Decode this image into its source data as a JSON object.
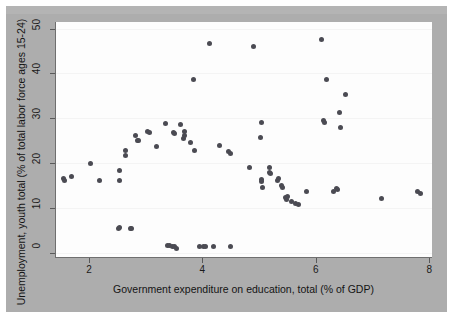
{
  "figure": {
    "background_color": "#adadad",
    "plot_background_color": "#fdfdfd",
    "marker_color": "#4b4b53",
    "axis_color": "#6f6f6f"
  },
  "chart_data": {
    "type": "scatter",
    "title": "",
    "subtitle": "",
    "xlabel": "Government expenditure on education, total (% of GDP)",
    "ylabel": "Unemployment, youth total (% of total labor force ages 15-24)",
    "xlim": [
      1.4,
      8.05
    ],
    "ylim": [
      -1.2,
      51.5
    ],
    "xticks": [
      2,
      4,
      6,
      8
    ],
    "yticks": [
      0,
      10,
      20,
      30,
      40,
      50
    ],
    "xtick_labels": [
      "2",
      "4",
      "6",
      "8"
    ],
    "ytick_labels": [
      "0",
      "10",
      "20",
      "30",
      "40",
      "50"
    ],
    "grid": "faint-horizontal",
    "legend": "none",
    "series": [
      {
        "name": "Countries",
        "marker": "circle",
        "color": "#4b4b53",
        "points": [
          [
            1.53,
            16.5
          ],
          [
            1.55,
            16.1
          ],
          [
            1.67,
            16.9
          ],
          [
            2.01,
            20.0
          ],
          [
            2.16,
            16.0
          ],
          [
            2.52,
            18.4
          ],
          [
            2.52,
            16.0
          ],
          [
            2.5,
            5.4
          ],
          [
            2.52,
            5.5
          ],
          [
            2.62,
            22.9
          ],
          [
            2.63,
            21.8
          ],
          [
            2.72,
            5.4
          ],
          [
            2.74,
            5.3
          ],
          [
            2.8,
            26.2
          ],
          [
            2.83,
            25.1
          ],
          [
            2.85,
            25.0
          ],
          [
            3.02,
            27.0
          ],
          [
            3.05,
            26.8
          ],
          [
            3.17,
            23.7
          ],
          [
            3.33,
            28.8
          ],
          [
            3.36,
            1.5
          ],
          [
            3.4,
            1.5
          ],
          [
            3.45,
            1.4
          ],
          [
            3.49,
            1.3
          ],
          [
            3.52,
            1.0
          ],
          [
            3.47,
            26.8
          ],
          [
            3.49,
            26.5
          ],
          [
            3.6,
            28.5
          ],
          [
            3.66,
            27.0
          ],
          [
            3.67,
            26.2
          ],
          [
            3.65,
            25.5
          ],
          [
            3.78,
            24.5
          ],
          [
            3.82,
            38.6
          ],
          [
            3.85,
            22.9
          ],
          [
            3.94,
            1.3
          ],
          [
            4.0,
            1.4
          ],
          [
            4.04,
            1.3
          ],
          [
            4.1,
            46.8
          ],
          [
            4.18,
            1.3
          ],
          [
            4.28,
            24.0
          ],
          [
            4.47,
            1.4
          ],
          [
            4.45,
            22.6
          ],
          [
            4.47,
            22.1
          ],
          [
            4.82,
            19.0
          ],
          [
            4.88,
            46.0
          ],
          [
            5.02,
            29.1
          ],
          [
            5.0,
            25.8
          ],
          [
            5.02,
            16.4
          ],
          [
            5.03,
            15.9
          ],
          [
            5.04,
            14.5
          ],
          [
            5.17,
            18.9
          ],
          [
            5.16,
            18.0
          ],
          [
            5.19,
            17.6
          ],
          [
            5.3,
            16.0
          ],
          [
            5.33,
            16.6
          ],
          [
            5.38,
            14.9
          ],
          [
            5.4,
            14.5
          ],
          [
            5.45,
            12.3
          ],
          [
            5.46,
            11.8
          ],
          [
            5.49,
            12.5
          ],
          [
            5.55,
            11.4
          ],
          [
            5.62,
            10.9
          ],
          [
            5.68,
            10.8
          ],
          [
            5.82,
            13.7
          ],
          [
            6.09,
            47.5
          ],
          [
            6.11,
            29.6
          ],
          [
            6.13,
            29.0
          ],
          [
            6.17,
            38.7
          ],
          [
            6.3,
            13.6
          ],
          [
            6.35,
            14.3
          ],
          [
            6.37,
            14.2
          ],
          [
            6.4,
            31.2
          ],
          [
            6.42,
            28.0
          ],
          [
            6.5,
            35.3
          ],
          [
            7.15,
            12.0
          ],
          [
            7.78,
            13.6
          ],
          [
            7.83,
            13.3
          ]
        ]
      }
    ]
  }
}
